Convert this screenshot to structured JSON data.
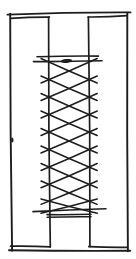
{
  "figure": {
    "kind": "hand-drawn-sketch",
    "canvas": {
      "width": 136,
      "height": 259
    },
    "colors": {
      "background": "#ffffff",
      "ink": "#1d1d1d"
    },
    "outer_frame": {
      "stroke": 1.9,
      "edges": {
        "top": {
          "x1": 7.5,
          "y1": 14.6,
          "x2": 130.5,
          "y2": 12.4,
          "bow": 1.3
        },
        "right": {
          "x1": 127.3,
          "y1": 12.6,
          "x2": 127.9,
          "y2": 251.2,
          "bow": 0.8
        },
        "bottom": {
          "x1": 130.2,
          "y1": 250.8,
          "x2": 9.0,
          "y2": 250.2,
          "bow": 0.7
        },
        "left": {
          "x1": 10.2,
          "y1": 13.6,
          "x2": 12.1,
          "y2": 250.8,
          "bow": 1.0
        }
      }
    },
    "bays": {
      "stroke": 1.7,
      "left": {
        "top": {
          "x1": 10.6,
          "y1": 18.4,
          "x2": 49.4,
          "y2": 17.1,
          "bow": 0.8
        },
        "inner": {
          "x1": 48.6,
          "y1": 17.2,
          "x2": 50.3,
          "y2": 246.8,
          "bow": 1.1
        },
        "bottom": {
          "x1": 10.6,
          "y1": 246.2,
          "x2": 50.4,
          "y2": 246.8,
          "bow": 0.6
        }
      },
      "right": {
        "top": {
          "x1": 88.0,
          "y1": 17.0,
          "x2": 127.2,
          "y2": 15.7,
          "bow": 0.8
        },
        "inner": {
          "x1": 88.4,
          "y1": 17.0,
          "x2": 89.9,
          "y2": 246.5,
          "bow": 1.1
        },
        "bottom": {
          "x1": 88.8,
          "y1": 246.6,
          "x2": 127.4,
          "y2": 247.3,
          "bow": 0.6
        }
      }
    },
    "rails": {
      "stroke": 1.6,
      "top": [
        {
          "x1": 37.0,
          "y1": 56.8,
          "x2": 98.5,
          "y2": 56.1,
          "bow": 0.6
        },
        {
          "x1": 33.5,
          "y1": 61.6,
          "x2": 102.0,
          "y2": 60.8,
          "bow": 0.6
        }
      ],
      "bottom": [
        {
          "x1": 33.0,
          "y1": 211.6,
          "x2": 106.0,
          "y2": 208.7,
          "bow": 0.6
        },
        {
          "x1": 47.0,
          "y1": 214.6,
          "x2": 91.0,
          "y2": 214.3,
          "bow": 0.4
        },
        {
          "x1": 47.2,
          "y1": 217.2,
          "x2": 91.0,
          "y2": 216.8,
          "bow": 0.4
        }
      ]
    },
    "lattice": {
      "stroke": 1.5,
      "left_x": 49.0,
      "right_x": 89.2,
      "overhang_x": 8.0,
      "contact_ys": [
        62.0,
        79.5,
        97.0,
        114.5,
        132.0,
        149.5,
        167.0,
        184.3,
        201.0,
        211.3
      ]
    },
    "ink_blobs": [
      {
        "cx": 66.5,
        "cy": 61.0,
        "rx": 5.5,
        "ry": 1.9,
        "rot": -6
      },
      {
        "cx": 12.3,
        "cy": 140.0,
        "rx": 1.2,
        "ry": 2.6,
        "rot": 0
      }
    ]
  }
}
